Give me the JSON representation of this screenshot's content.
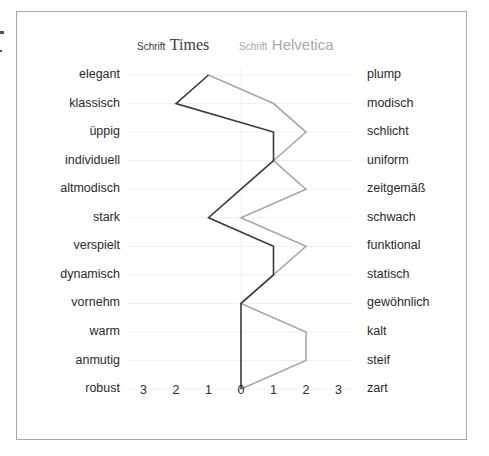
{
  "chart_data": {
    "type": "line",
    "title": "",
    "orientation": "horizontal-semantic-differential",
    "legend": [
      {
        "prefix": "Schrift",
        "name": "Times",
        "color": "#3a3a3a"
      },
      {
        "prefix": "Schrift",
        "name": "Helvetica",
        "color": "#a8a8a8"
      }
    ],
    "left_labels": [
      "elegant",
      "klassisch",
      "üppig",
      "individuell",
      "altmodisch",
      "stark",
      "verspielt",
      "dynamisch",
      "vornehm",
      "warm",
      "anmutig",
      "robust"
    ],
    "right_labels": [
      "plump",
      "modisch",
      "schlicht",
      "uniform",
      "zeitgemäß",
      "schwach",
      "funktional",
      "statisch",
      "gewöhnlich",
      "kalt",
      "steif",
      "zart"
    ],
    "x_ticks": [
      "3",
      "2",
      "1",
      "0",
      "1",
      "2",
      "3"
    ],
    "xlim": [
      -3,
      3
    ],
    "series": [
      {
        "name": "Schrift Times",
        "color": "#3a3a3a",
        "values": [
          -1,
          -2,
          1,
          1,
          0,
          -1,
          1,
          1,
          0,
          0,
          0,
          0
        ]
      },
      {
        "name": "Schrift Helvetica",
        "color": "#a8a8a8",
        "values": [
          -1,
          1,
          2,
          1,
          2,
          0,
          2,
          1,
          0,
          2,
          2,
          0
        ]
      }
    ],
    "grid": true
  },
  "legend": {
    "times_prefix": "Schrift",
    "times_name": "Times",
    "helv_prefix": "Schrift",
    "helv_name": "Helvetica"
  }
}
